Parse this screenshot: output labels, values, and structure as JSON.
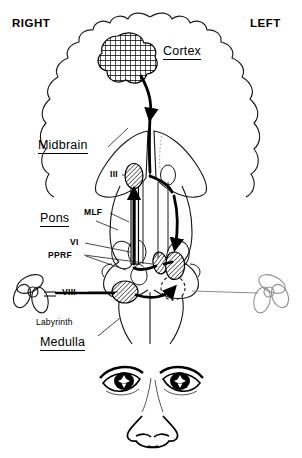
{
  "figure": {
    "orientation": {
      "right_label": "RIGHT",
      "left_label": "LEFT"
    },
    "region_labels": [
      {
        "id": "cortex",
        "text": "Cortex",
        "underlined": true
      },
      {
        "id": "midbrain",
        "text": "Midbrain",
        "underlined": true
      },
      {
        "id": "pons",
        "text": "Pons",
        "underlined": true
      },
      {
        "id": "medulla",
        "text": "Medulla",
        "underlined": true
      }
    ],
    "structure_labels": [
      {
        "id": "nucleus-iii",
        "text": "III",
        "style": "bold"
      },
      {
        "id": "mlf",
        "text": "MLF",
        "style": "bold"
      },
      {
        "id": "nucleus-vi",
        "text": "VI",
        "style": "bold"
      },
      {
        "id": "pprf",
        "text": "PPRF",
        "style": "bold"
      },
      {
        "id": "nerve-viii",
        "text": "VIII",
        "style": "bold"
      },
      {
        "id": "labyrinth",
        "text": "Labyrinth",
        "style": "plain"
      }
    ],
    "colors": {
      "ink": "#000000",
      "paper": "#ffffff",
      "faint_outline": "#8c8c8c",
      "hatch_fill": "#c8c8c8"
    },
    "shaded_nuclei": [
      {
        "id": "nucleus-iii-blob",
        "label": "III"
      },
      {
        "id": "nucleus-vi-blob",
        "label": "VI"
      },
      {
        "id": "pprf-blob",
        "label": "PPRF"
      },
      {
        "id": "vestibular-blob",
        "label": "VIII"
      }
    ],
    "lesion": {
      "id": "cortical-lesion",
      "pattern": "cross-hatch",
      "side": "right"
    },
    "face": {
      "eyes": 2,
      "gaze": "conjugate-left",
      "nose": true
    }
  }
}
